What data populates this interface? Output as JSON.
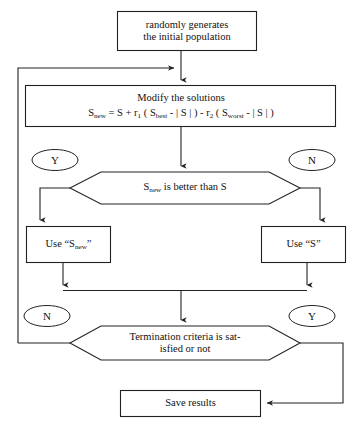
{
  "diagram": {
    "type": "flowchart",
    "stroke_color": "#222222",
    "fill_color": "#ffffff",
    "background": "#ffffff"
  },
  "nodes": {
    "start_box": {
      "shape": "rectangle",
      "line1": "randomly generates",
      "line2": "the initial population"
    },
    "modify_box": {
      "shape": "rectangle",
      "title": "Modify the solutions",
      "formula_parts": {
        "s_new": "S",
        "s_new_sub": "new",
        "eq": " = S + r",
        "r1_sub": "1",
        "open1": " ( S",
        "best_sub": "best",
        "mid1": " - | S | ) - r",
        "r2_sub": "2",
        "open2": " ( S",
        "worst_sub": "worst",
        "mid2": " - | S | )"
      },
      "formula_plain": "S_new = S + r1 ( S_best - | S | ) - r2 ( S_worst - | S | )"
    },
    "decision_better": {
      "shape": "hexagon",
      "text_pre": "S",
      "text_sub": "new",
      "text_post": " is better than S"
    },
    "use_snew_box": {
      "shape": "rectangle",
      "text_pre": "Use “S",
      "text_sub": "new",
      "text_post": "”"
    },
    "use_s_box": {
      "shape": "rectangle",
      "text": "Use “S”"
    },
    "decision_termination": {
      "shape": "hexagon",
      "line1": "Termination criteria is sat-",
      "line2": "isfied or not"
    },
    "save_results_box": {
      "shape": "rectangle",
      "text": "Save results"
    }
  },
  "labels": {
    "better_yes": "Y",
    "better_no": "N",
    "termination_no": "N",
    "termination_yes": "Y"
  },
  "edges": [
    {
      "name": "start-to-modify",
      "from": "start_box",
      "to": "modify_box",
      "label": ""
    },
    {
      "name": "feedback-loop-to-modify",
      "from": "decision_termination",
      "to": "modify_box",
      "label": "N"
    },
    {
      "name": "modify-to-decision",
      "from": "modify_box",
      "to": "decision_better",
      "label": ""
    },
    {
      "name": "decision-yes-to-use-snew",
      "from": "decision_better",
      "to": "use_snew_box",
      "label": "Y"
    },
    {
      "name": "decision-no-to-use-s",
      "from": "decision_better",
      "to": "use_s_box",
      "label": "N"
    },
    {
      "name": "use-snew-to-merge",
      "from": "use_snew_box",
      "to": "decision_termination",
      "label": ""
    },
    {
      "name": "use-s-to-merge",
      "from": "use_s_box",
      "to": "decision_termination",
      "label": ""
    },
    {
      "name": "termination-yes-to-save",
      "from": "decision_termination",
      "to": "save_results_box",
      "label": "Y"
    }
  ]
}
